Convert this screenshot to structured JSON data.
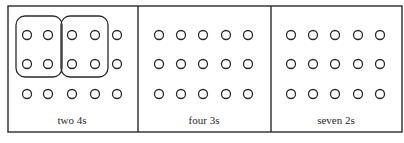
{
  "figure": {
    "panels": [
      {
        "label": "two 4s",
        "rows": 3,
        "cols": 5,
        "groups": [
          {
            "name": "group-1",
            "cols": [
              0,
              1
            ],
            "rows": [
              0,
              1
            ]
          },
          {
            "name": "group-2",
            "cols": [
              2,
              3
            ],
            "rows": [
              0,
              1
            ]
          }
        ]
      },
      {
        "label": "four 3s",
        "rows": 3,
        "cols": 5,
        "groups": []
      },
      {
        "label": "seven 2s",
        "rows": 3,
        "cols": 5,
        "groups": []
      }
    ],
    "colors": {
      "stroke": "#2a2a2a",
      "background": "#ffffff"
    }
  }
}
